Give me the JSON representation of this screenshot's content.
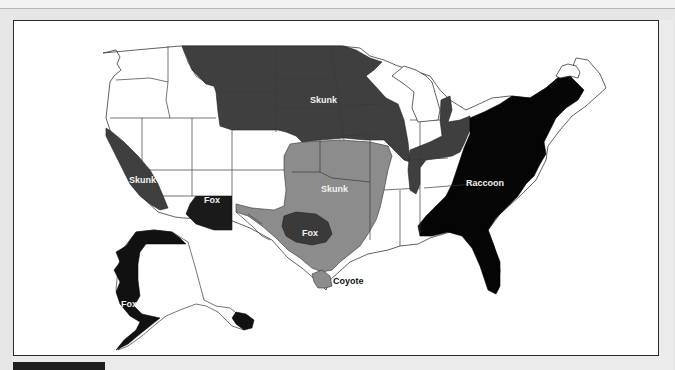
{
  "map": {
    "title": "Rabies reservoir species regions, United States",
    "colors": {
      "skunk": "#3f3f3f",
      "skunk_south_central": "#8c8c8c",
      "raccoon": "#050505",
      "fox": "#1a1a1a",
      "fox_texas": "#3a3a3a",
      "coyote": "#8c8c8c",
      "unaffected": "#ffffff",
      "border": "#3a3a3a"
    },
    "regions": [
      {
        "species": "Skunk",
        "area": "North-central states",
        "label": "Skunk"
      },
      {
        "species": "Skunk",
        "area": "California",
        "label": "Skunk"
      },
      {
        "species": "Skunk",
        "area": "South-central states",
        "label": "Skunk"
      },
      {
        "species": "Fox",
        "area": "Arizona",
        "label": "Fox"
      },
      {
        "species": "Fox",
        "area": "Central Texas",
        "label": "Fox"
      },
      {
        "species": "Fox",
        "area": "Western & northern Alaska",
        "label": "Fox"
      },
      {
        "species": "Raccoon",
        "area": "Eastern states",
        "label": "Raccoon"
      },
      {
        "species": "Coyote",
        "area": "South Texas",
        "label": "Coyote"
      }
    ]
  }
}
